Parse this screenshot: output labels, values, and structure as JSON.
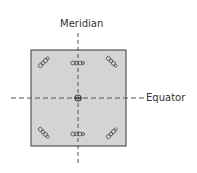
{
  "diagram": {
    "labels": {
      "meridian": "Meridian",
      "equator": "Equator"
    },
    "square": {
      "x": 31,
      "y": 50,
      "width": 95,
      "height": 96,
      "fill": "#d4d4d4",
      "stroke": "#555555"
    },
    "meridian_line": {
      "x": 78,
      "y1": 33,
      "y2": 163,
      "color": "#555555"
    },
    "equator_line": {
      "y": 98,
      "x1": 11,
      "x2": 145,
      "color": "#555555"
    },
    "marks": [
      {
        "name": "mark-top-left",
        "cx": 44,
        "cy": 62,
        "rotate": -45
      },
      {
        "name": "mark-top-center",
        "cx": 78,
        "cy": 63,
        "rotate": 0
      },
      {
        "name": "mark-top-right",
        "cx": 112,
        "cy": 62,
        "rotate": 45
      },
      {
        "name": "mark-bottom-left",
        "cx": 44,
        "cy": 133,
        "rotate": 45
      },
      {
        "name": "mark-bottom-center",
        "cx": 78,
        "cy": 134,
        "rotate": 0
      },
      {
        "name": "mark-bottom-right",
        "cx": 112,
        "cy": 133,
        "rotate": -45
      }
    ],
    "center_mark": {
      "cx": 78,
      "cy": 98
    }
  }
}
